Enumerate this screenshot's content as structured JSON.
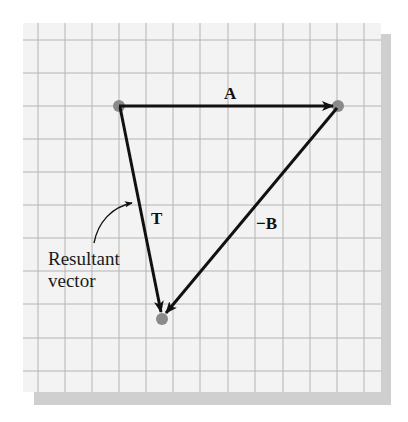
{
  "figure": {
    "type": "vector-addition-triangle",
    "grid": {
      "background": "#f3f3f3",
      "line_color": "#b4b4b4",
      "shadow_color": "#cfcfcf",
      "vertical_lines_x": [
        38,
        65,
        92,
        119,
        146,
        173,
        200,
        228,
        255,
        283,
        310,
        337,
        364
      ],
      "horizontal_lines_y": [
        40,
        73,
        106,
        139,
        172,
        205,
        238,
        271,
        304,
        338,
        371
      ]
    },
    "points": {
      "origin": {
        "x": 119,
        "y": 106
      },
      "tip_a": {
        "x": 338,
        "y": 106
      },
      "tip_t": {
        "x": 162,
        "y": 318
      },
      "dot_color": "#8a8a8a"
    },
    "vectors": [
      {
        "name": "A",
        "label": "A",
        "from": "origin",
        "to": "tip_a"
      },
      {
        "name": "-B",
        "label": "−B",
        "from": "tip_a",
        "to": "tip_t"
      },
      {
        "name": "T",
        "label": "T",
        "from": "origin",
        "to": "tip_t"
      }
    ],
    "labels": {
      "vector_a": "A",
      "vector_t": "T",
      "vector_neg_b": "−B",
      "annotation_line1": "Resultant",
      "annotation_line2": "vector"
    }
  }
}
